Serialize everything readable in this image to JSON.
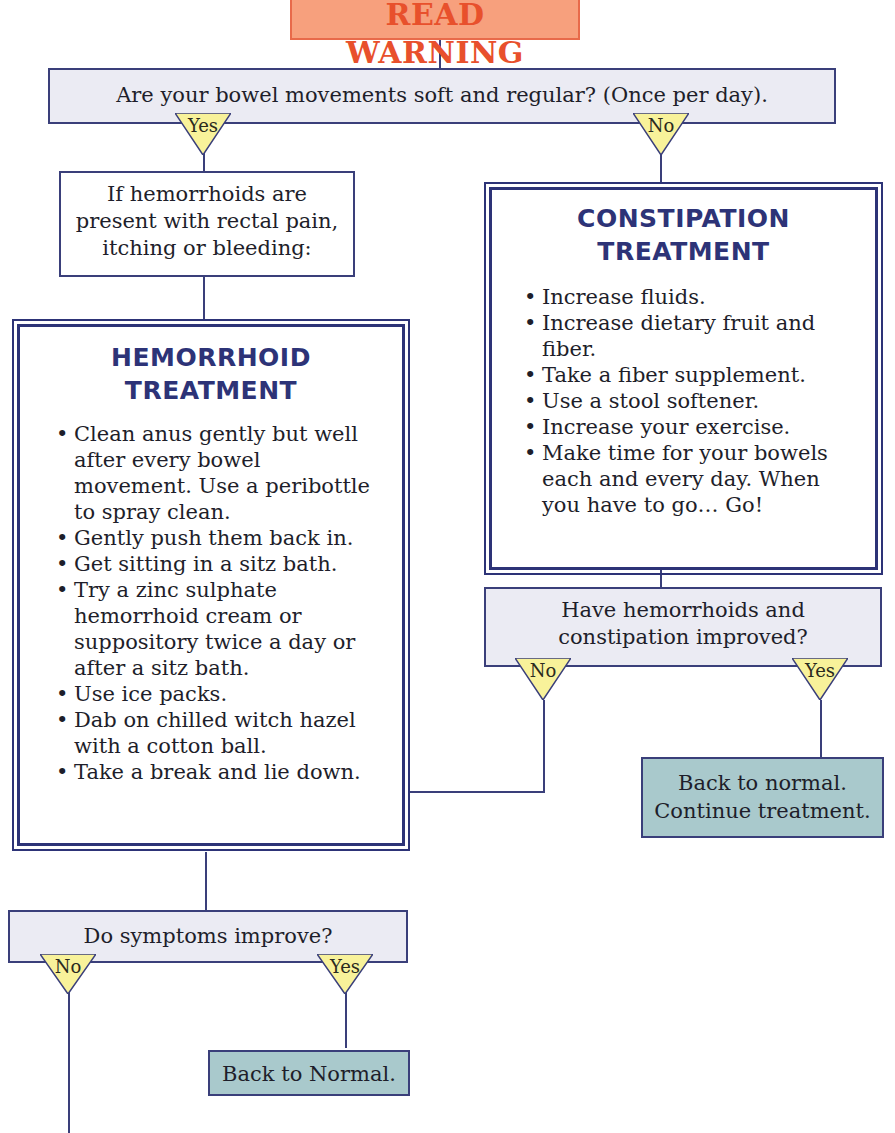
{
  "warning": {
    "label": "READ WARNING"
  },
  "q1": {
    "text": "Are your bowel movements soft and regular? (Once per day).",
    "yes": "Yes",
    "no": "No"
  },
  "hemorrhoid_check": {
    "text": "If hemorrhoids are present with rectal pain, itching or bleeding:"
  },
  "hemorrhoid_treatment": {
    "title_1": "HEMORRHOID",
    "title_2": "TREATMENT",
    "items": [
      "Clean anus gently but well after every bowel movement. Use a peribottle to spray clean.",
      "Gently push them back in.",
      "Get sitting in a sitz bath.",
      "Try a zinc sulphate hemorrhoid cream or suppository twice a day or after a sitz bath.",
      "Use ice packs.",
      "Dab on chilled witch hazel with a cotton ball.",
      "Take a break and lie down."
    ]
  },
  "constipation_treatment": {
    "title_1": "CONSTIPATION",
    "title_2": "TREATMENT",
    "items": [
      "Increase fluids.",
      "Increase dietary fruit and fiber.",
      "Take a fiber supplement.",
      "Use a stool softener.",
      "Increase your exercise.",
      "Make time for your bowels each and every day. When you have to go… Go!"
    ]
  },
  "q2": {
    "text": "Have hemorrhoids and constipation improved?",
    "yes": "Yes",
    "no": "No"
  },
  "result_continue": {
    "line_1": "Back to normal.",
    "line_2": "Continue treatment."
  },
  "q3": {
    "text": "Do symptoms improve?",
    "yes": "Yes",
    "no": "No"
  },
  "result_normal": {
    "text": "Back to Normal."
  },
  "colors": {
    "border": "#3a3f7a",
    "title": "#2d3377",
    "warning_bg": "#f7a07d",
    "warning_text": "#e8502c",
    "question_bg": "#ebebf3",
    "result_bg": "#a9c9cc",
    "triangle": "#f8f29a"
  }
}
